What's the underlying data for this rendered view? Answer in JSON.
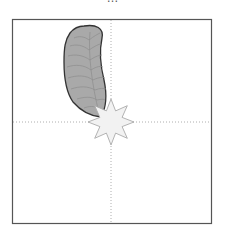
{
  "caption": {
    "text": "…",
    "note": "cut off at top edge; only descenders visible"
  },
  "frame": {
    "x": 12,
    "y": 19,
    "width": 200,
    "height": 205,
    "stroke": "#555555"
  },
  "crosshair": {
    "x": 111,
    "y": 122,
    "stroke": "#999999"
  },
  "leaf": {
    "fill": "#a9a9a9",
    "stroke": "#333333",
    "vein": "#8a8a8a"
  },
  "star": {
    "cx": 111,
    "cy": 122,
    "points": 8,
    "outer_r": 23,
    "inner_r": 12,
    "fill": "#f2f2f2",
    "stroke": "#aaaaaa"
  }
}
